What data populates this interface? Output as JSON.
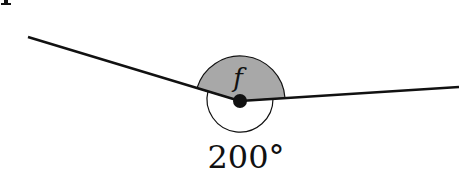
{
  "diagram": {
    "type": "angle-diagram",
    "vertex": {
      "x": 240,
      "y": 101
    },
    "rays": [
      {
        "name": "left-ray",
        "end": {
          "x": 28,
          "y": 37
        }
      },
      {
        "name": "right-ray",
        "end": {
          "x": 459,
          "y": 87
        }
      }
    ],
    "labels": {
      "unknown_angle": "f",
      "reflex_angle": "200°",
      "corner_glyph": "p"
    },
    "colors": {
      "line": "#111111",
      "shaded_sector": "#a8a8a8",
      "background": "#ffffff"
    }
  }
}
